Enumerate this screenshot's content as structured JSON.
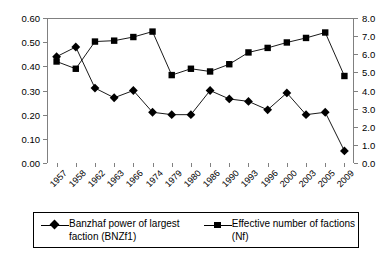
{
  "chart_data": {
    "type": "line",
    "title": "",
    "subtitle": "",
    "xlabel": "",
    "ylabel": "",
    "grid": false,
    "legend_position": "bottom",
    "categories": [
      "1957",
      "1958",
      "1962",
      "1963",
      "1966",
      "1974",
      "1979",
      "1980",
      "1986",
      "1990",
      "1993",
      "1996",
      "2000",
      "2003",
      "2005",
      "2009"
    ],
    "left_axis": {
      "label": "",
      "ylim": [
        0.0,
        0.6
      ],
      "ticks": [
        "0.00",
        "0.10",
        "0.20",
        "0.30",
        "0.40",
        "0.50",
        "0.60"
      ],
      "tick_values": [
        0.0,
        0.1,
        0.2,
        0.3,
        0.4,
        0.5,
        0.6
      ]
    },
    "right_axis": {
      "label": "",
      "ylim": [
        0.0,
        8.0
      ],
      "ticks": [
        "0.0",
        "1.0",
        "2.0",
        "3.0",
        "4.0",
        "5.0",
        "6.0",
        "7.0",
        "8.0"
      ],
      "tick_values": [
        0.0,
        1.0,
        2.0,
        3.0,
        4.0,
        5.0,
        6.0,
        7.0,
        8.0
      ]
    },
    "series": [
      {
        "name": "Banzhaf power of largest faction (BNZf1)",
        "axis": "left",
        "marker": "diamond",
        "color": "#000000",
        "values": [
          0.44,
          0.48,
          0.31,
          0.27,
          0.3,
          0.21,
          0.2,
          0.2,
          0.3,
          0.265,
          0.255,
          0.22,
          0.29,
          0.2,
          0.21,
          0.05
        ]
      },
      {
        "name": "Effective number of factions (Nf)",
        "axis": "right",
        "marker": "square",
        "color": "#000000",
        "values": [
          5.6,
          5.2,
          6.7,
          6.75,
          6.95,
          7.25,
          4.85,
          5.2,
          5.05,
          5.45,
          6.1,
          6.35,
          6.65,
          6.9,
          7.2,
          4.8
        ]
      }
    ]
  },
  "legend": {
    "entries": [
      {
        "label": "Banzhaf power of largest faction (BNZf1)",
        "marker": "diamond"
      },
      {
        "label": "Effective number of factions (Nf)",
        "marker": "square"
      }
    ]
  }
}
